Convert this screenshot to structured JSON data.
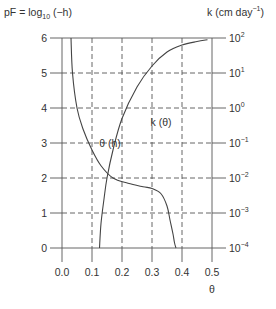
{
  "chart_data": {
    "type": "line",
    "title": "",
    "ylabel_left": "pF = log10 (−h)",
    "ylabel_left_parts": {
      "pre": "pF = log",
      "sub": "10",
      "post": " (−h)"
    },
    "ylabel_right": "k (cm day−1)",
    "ylabel_right_parts": {
      "pre": "k (cm day",
      "sup": "−1",
      "post": ")"
    },
    "xlabel": "θ",
    "xlim": [
      0.0,
      0.5
    ],
    "ylim_left": [
      0,
      6
    ],
    "ylim_right_log10": [
      -4,
      2
    ],
    "x_ticks": [
      "0.0",
      "0.1",
      "0.2",
      "0.3",
      "0.4",
      "0.5"
    ],
    "y_left_ticks": [
      "0",
      "1",
      "2",
      "3",
      "4",
      "5",
      "6"
    ],
    "y_right_ticks": [
      {
        "base": "10",
        "exp": "−4"
      },
      {
        "base": "10",
        "exp": "−3"
      },
      {
        "base": "10",
        "exp": "−2"
      },
      {
        "base": "10",
        "exp": "−1"
      },
      {
        "base": "10",
        "exp": "0"
      },
      {
        "base": "10",
        "exp": "1"
      },
      {
        "base": "10",
        "exp": "2"
      }
    ],
    "grid": "dashed",
    "series": [
      {
        "name": "θ (h)",
        "axis": "left",
        "x": [
          0.03,
          0.035,
          0.05,
          0.07,
          0.1,
          0.13,
          0.17,
          0.22,
          0.27,
          0.3,
          0.33,
          0.35,
          0.36,
          0.37,
          0.375,
          0.38
        ],
        "y": [
          6.0,
          5.0,
          4.0,
          3.4,
          2.8,
          2.35,
          2.0,
          1.85,
          1.75,
          1.7,
          1.55,
          1.2,
          0.8,
          0.4,
          0.15,
          0.0
        ]
      },
      {
        "name": "k (θ)",
        "axis": "right",
        "x": [
          0.125,
          0.13,
          0.14,
          0.15,
          0.17,
          0.2,
          0.25,
          0.3,
          0.35,
          0.4,
          0.45,
          0.485
        ],
        "log10_k": [
          -4.0,
          -3.3,
          -2.6,
          -2.0,
          -1.2,
          -0.3,
          0.6,
          1.2,
          1.6,
          1.8,
          1.9,
          1.95
        ]
      }
    ],
    "annotations": [
      {
        "text": "θ (h)",
        "x": 0.16,
        "y": 2.9
      },
      {
        "text": "k (θ)",
        "x": 0.33,
        "y": 3.5
      }
    ]
  }
}
